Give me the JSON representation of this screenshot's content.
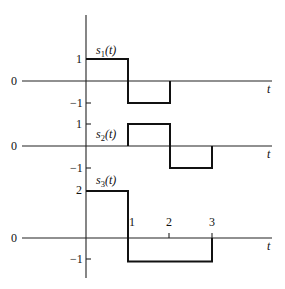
{
  "figure": {
    "time_axis_label": "t",
    "zero_label": "0",
    "panels": [
      {
        "id": "s1",
        "label_base": "s",
        "label_sub": "1",
        "label_arg": "(t)",
        "y_tick_labels": {
          "upper": "1",
          "lower": "−1"
        },
        "points": [
          [
            0,
            1
          ],
          [
            1,
            1
          ],
          [
            1,
            -1
          ],
          [
            2,
            -1
          ],
          [
            2,
            0
          ]
        ]
      },
      {
        "id": "s2",
        "label_base": "s",
        "label_sub": "2",
        "label_arg": "(t)",
        "y_tick_labels": {
          "upper": "1",
          "lower": "−1"
        },
        "points": [
          [
            1,
            0
          ],
          [
            1,
            1
          ],
          [
            2,
            1
          ],
          [
            2,
            -1
          ],
          [
            3,
            -1
          ],
          [
            3,
            0
          ]
        ]
      },
      {
        "id": "s3",
        "label_base": "s",
        "label_sub": "3",
        "label_arg": "(t)",
        "y_tick_labels": {
          "upper": "2",
          "lower": "−1"
        },
        "points": [
          [
            0,
            2
          ],
          [
            1,
            2
          ],
          [
            1,
            -1
          ],
          [
            3,
            -1
          ],
          [
            3,
            0
          ]
        ]
      }
    ],
    "t_tick_labels": [
      "1",
      "2",
      "3"
    ]
  },
  "chart_data": {
    "type": "line",
    "title": "",
    "xlabel": "t",
    "ylabel": "",
    "grid": false,
    "series": [
      {
        "name": "s1(t)",
        "x": [
          0,
          1,
          1,
          2,
          2
        ],
        "y": [
          1,
          1,
          -1,
          -1,
          0
        ]
      },
      {
        "name": "s2(t)",
        "x": [
          1,
          1,
          2,
          2,
          3,
          3
        ],
        "y": [
          0,
          1,
          1,
          -1,
          -1,
          0
        ]
      },
      {
        "name": "s3(t)",
        "x": [
          0,
          1,
          1,
          3,
          3
        ],
        "y": [
          2,
          2,
          -1,
          -1,
          0
        ]
      }
    ],
    "x_ticks": [
      1,
      2,
      3
    ],
    "y_ticks": {
      "s1(t)": [
        1,
        0,
        -1
      ],
      "s2(t)": [
        1,
        0,
        -1
      ],
      "s3(t)": [
        2,
        0,
        -1
      ]
    }
  }
}
